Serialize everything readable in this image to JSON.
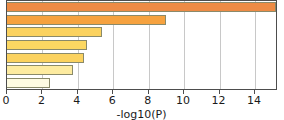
{
  "chart_data": {
    "type": "bar",
    "orientation": "horizontal",
    "title": "",
    "subtitle": "",
    "xlabel": "-log10(P)",
    "ylabel": "",
    "xlim": [
      0,
      15.3
    ],
    "grid": true,
    "legend": false,
    "xticks": [
      0,
      2,
      4,
      6,
      8,
      10,
      12,
      14
    ],
    "xticklabels": [
      "0",
      "2",
      "4",
      "6",
      "8",
      "10",
      "12",
      "14"
    ],
    "categories": [
      "",
      "",
      "",
      "",
      "",
      "",
      ""
    ],
    "values": [
      15.2,
      8.95,
      5.35,
      4.5,
      4.35,
      3.75,
      2.4
    ],
    "bar_colors": [
      "#ed8b45",
      "#f5a council",
      "#fbd25f",
      "#fcd862",
      "#fbd25f",
      "#fdeba0",
      "#fefbe2"
    ],
    "bar_edge_color": "#8a8a6a",
    "gridline_color": "#c8c8c8",
    "axis_color": "#4d4d4d",
    "background_color": "#ffffff"
  }
}
